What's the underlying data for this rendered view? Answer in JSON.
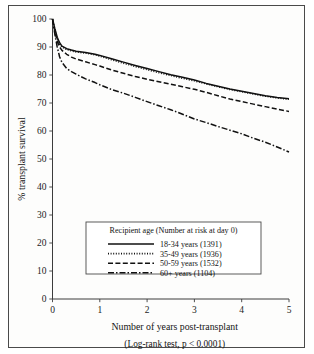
{
  "figure": {
    "background_color": "#fdfdfc",
    "frame_color": "#4a4a4a",
    "ink_color": "#111111"
  },
  "chart_data": {
    "type": "line",
    "title": "",
    "subtitle": "",
    "xlabel": "Number of years post-transplant",
    "ylabel": "% transplant survival",
    "footnote": "(Log-rank test, p < 0.0001)",
    "xlim": [
      0,
      5
    ],
    "ylim": [
      0,
      100
    ],
    "xticks": [
      0,
      1,
      2,
      3,
      4,
      5
    ],
    "yticks": [
      0,
      10,
      20,
      30,
      40,
      50,
      60,
      70,
      80,
      90,
      100
    ],
    "xtick_labels": [
      "0",
      "1",
      "2",
      "3",
      "4",
      "5"
    ],
    "ytick_labels": [
      "0",
      "10",
      "20",
      "30",
      "40",
      "50",
      "60",
      "70",
      "80",
      "90",
      "100"
    ],
    "grid": false,
    "legend_position": "lower-center-inside",
    "legend_title": "Recipient age (Number at risk at day 0)",
    "series": [
      {
        "name": "18-34 years (1391)",
        "label": "18-34 years (1391)",
        "group": "18-34 years",
        "n_at_risk": 1391,
        "style": "solid",
        "x": [
          0,
          0.05,
          0.1,
          0.15,
          0.2,
          0.3,
          0.4,
          0.5,
          0.7,
          0.9,
          1.0,
          1.25,
          1.5,
          1.75,
          2.0,
          2.25,
          2.5,
          2.75,
          3.0,
          3.25,
          3.5,
          3.75,
          4.0,
          4.25,
          4.5,
          4.75,
          5.0
        ],
        "y": [
          100,
          96.5,
          93.5,
          91.5,
          90.3,
          89.4,
          88.9,
          88.5,
          88.0,
          87.4,
          87.0,
          85.8,
          84.6,
          83.4,
          82.3,
          81.2,
          80.1,
          79.2,
          78.2,
          77.0,
          76.0,
          75.0,
          74.2,
          73.4,
          72.6,
          72.0,
          71.5
        ]
      },
      {
        "name": "35-49 years (1936)",
        "label": "35-49 years (1936)",
        "group": "35-49 years",
        "n_at_risk": 1936,
        "style": "dotted",
        "x": [
          0,
          0.05,
          0.1,
          0.15,
          0.2,
          0.3,
          0.4,
          0.5,
          0.7,
          0.9,
          1.0,
          1.25,
          1.5,
          1.75,
          2.0,
          2.25,
          2.5,
          2.75,
          3.0,
          3.25,
          3.5,
          3.75,
          4.0,
          4.25,
          4.5,
          4.75,
          5.0
        ],
        "y": [
          100,
          96.0,
          93.0,
          91.0,
          90.0,
          89.1,
          88.6,
          88.2,
          87.8,
          87.2,
          86.7,
          85.4,
          84.2,
          83.0,
          81.9,
          80.8,
          79.8,
          78.8,
          77.9,
          76.8,
          75.8,
          74.8,
          74.0,
          73.2,
          72.4,
          71.8,
          71.3
        ]
      },
      {
        "name": "50-59 years (1532)",
        "label": "50-59 years (1532)",
        "group": "50-59 years",
        "n_at_risk": 1532,
        "style": "dashed",
        "x": [
          0,
          0.05,
          0.1,
          0.15,
          0.2,
          0.3,
          0.4,
          0.5,
          0.7,
          0.9,
          1.0,
          1.25,
          1.5,
          1.75,
          2.0,
          2.25,
          2.5,
          2.75,
          3.0,
          3.25,
          3.5,
          3.75,
          4.0,
          4.25,
          4.5,
          4.75,
          5.0
        ],
        "y": [
          100,
          95.5,
          92.0,
          90.0,
          88.8,
          87.4,
          86.4,
          85.7,
          84.7,
          83.7,
          83.2,
          81.8,
          80.6,
          79.5,
          78.5,
          77.6,
          76.7,
          75.8,
          74.9,
          73.8,
          72.6,
          71.4,
          70.5,
          69.6,
          68.7,
          67.8,
          67.0
        ]
      },
      {
        "name": "60+ years (1104)",
        "label": "60+ years (1104)",
        "group": "60+ years",
        "n_at_risk": 1104,
        "style": "dashdot",
        "x": [
          0,
          0.05,
          0.1,
          0.15,
          0.2,
          0.3,
          0.4,
          0.5,
          0.7,
          0.9,
          1.0,
          1.25,
          1.5,
          1.75,
          2.0,
          2.25,
          2.5,
          2.75,
          3.0,
          3.25,
          3.5,
          3.75,
          4.0,
          4.25,
          4.5,
          4.75,
          5.0
        ],
        "y": [
          100,
          94.5,
          90.0,
          86.5,
          84.5,
          82.3,
          81.2,
          80.3,
          78.6,
          77.3,
          76.5,
          74.8,
          73.5,
          72.0,
          70.5,
          69.0,
          67.6,
          66.0,
          64.3,
          63.0,
          61.6,
          60.3,
          59.0,
          57.4,
          56.0,
          54.3,
          52.5
        ]
      }
    ]
  }
}
